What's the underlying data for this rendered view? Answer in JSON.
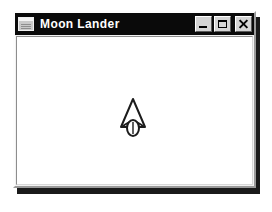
{
  "desktop": {
    "background_color": "#ffffff"
  },
  "window": {
    "title": "Moon Lander",
    "icon": "window-document-icon",
    "titlebar_color": "#0a0a0a",
    "titlebar_text_color": "#ffffff",
    "frame_color": "#f2f2f2",
    "client_background": "#ffffff",
    "shadow_color": "#1a1a1a",
    "controls": [
      {
        "name": "minimize",
        "label": "_",
        "glyph": "minimize-icon",
        "tooltip": "Minimize"
      },
      {
        "name": "maximize",
        "label": "□",
        "glyph": "maximize-icon",
        "tooltip": "Maximize"
      },
      {
        "name": "close",
        "label": "×",
        "glyph": "close-icon",
        "tooltip": "Close"
      }
    ]
  },
  "game": {
    "sprite_name": "lunar-lander-craft",
    "sprite_color": "#1c1c1c",
    "sprite_fill": "#ffffff",
    "position": {
      "x": 132,
      "y": 116
    },
    "size": {
      "width": 26,
      "height": 38
    }
  }
}
